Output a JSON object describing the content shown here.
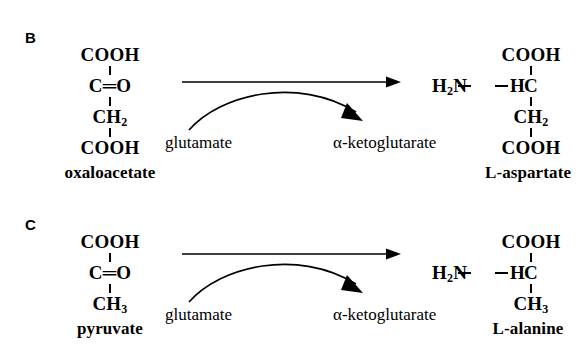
{
  "figure": {
    "background_color": "#ffffff",
    "ink_color": "#000000"
  },
  "panels": [
    {
      "id": "B",
      "letter": "B",
      "substrate": {
        "name": "oxaloacetate",
        "rows": [
          "COOH",
          "C=O",
          "CH2",
          "COOH"
        ],
        "row_display": [
          "COOH",
          "C═O",
          "CH",
          "COOH"
        ],
        "subscripts": [
          "",
          "",
          "2",
          ""
        ]
      },
      "product": {
        "name": "L-aspartate",
        "top": "COOH",
        "left_group": "H",
        "left_group_sub": "2",
        "left_group_tail": "N",
        "center": "C",
        "right": "H",
        "lower": "CH",
        "lower_sub": "2",
        "bottom": "COOH"
      },
      "cosubstrate_in": "glutamate",
      "cosubstrate_out": "α-ketoglutarate"
    },
    {
      "id": "C",
      "letter": "C",
      "substrate": {
        "name": "pyruvate",
        "rows": [
          "COOH",
          "C=O",
          "CH3"
        ],
        "row_display": [
          "COOH",
          "C═O",
          "CH"
        ],
        "subscripts": [
          "",
          "",
          "3"
        ]
      },
      "product": {
        "name": "L-alanine",
        "top": "COOH",
        "left_group": "H",
        "left_group_sub": "2",
        "left_group_tail": "N",
        "center": "C",
        "right": "H",
        "lower": "CH",
        "lower_sub": "3",
        "bottom": ""
      },
      "cosubstrate_in": "glutamate",
      "cosubstrate_out": "α-ketoglutarate"
    }
  ]
}
